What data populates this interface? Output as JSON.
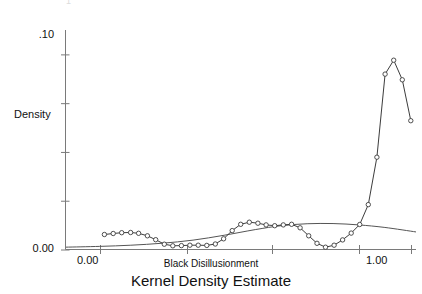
{
  "figure": {
    "caption": "Kernel Density Estimate",
    "top_fragment": "1"
  },
  "chart_data": {
    "type": "line",
    "title": "Kernel Density Estimate",
    "xlabel": "Black Disillusionment",
    "ylabel": "Density",
    "xlim": [
      -0.13,
      1.22
    ],
    "ylim": [
      0.0,
      0.1125
    ],
    "grid": false,
    "legend": false,
    "x_tick_values": [
      0.0,
      0.335,
      0.665,
      1.0,
      1.2
    ],
    "x_tick_labels": [
      "0.00",
      "",
      "",
      "1.00",
      ""
    ],
    "y_tick_values": [
      0.0,
      0.025,
      0.05,
      0.075,
      0.1
    ],
    "y_tick_labels": [
      "0.00",
      "",
      "",
      "",
      ".10"
    ],
    "series": [
      {
        "name": "Kernel density estimate",
        "style": "line-with-circle-markers",
        "color": "#3c3c3c",
        "marker": "open-circle",
        "x": [
          0.018,
          0.052,
          0.085,
          0.119,
          0.15,
          0.184,
          0.216,
          0.249,
          0.282,
          0.315,
          0.348,
          0.38,
          0.413,
          0.446,
          0.478,
          0.511,
          0.544,
          0.577,
          0.61,
          0.642,
          0.675,
          0.708,
          0.74,
          0.773,
          0.806,
          0.838,
          0.871,
          0.904,
          0.937,
          0.97,
          1.003,
          1.036,
          1.069,
          1.101,
          1.134,
          1.167,
          1.2
        ],
        "y": [
          0.0077,
          0.0082,
          0.0086,
          0.0087,
          0.0083,
          0.007,
          0.005,
          0.0027,
          0.0019,
          0.002,
          0.0022,
          0.0022,
          0.0021,
          0.0028,
          0.0055,
          0.0097,
          0.0129,
          0.014,
          0.0135,
          0.0126,
          0.0122,
          0.0126,
          0.0129,
          0.0111,
          0.007,
          0.0032,
          0.0012,
          0.0022,
          0.0049,
          0.0084,
          0.0128,
          0.023,
          0.0473,
          0.0899,
          0.097,
          0.087,
          0.066
        ],
        "peak": {
          "x": 1.134,
          "y": 0.097
        }
      },
      {
        "name": "Smooth reference density",
        "style": "smooth-line",
        "color": "#555555",
        "marker": "none",
        "x": [
          -0.13,
          0.0,
          0.12,
          0.24,
          0.36,
          0.48,
          0.6,
          0.7,
          0.8,
          0.9,
          1.0,
          1.1,
          1.22
        ],
        "y": [
          0.0012,
          0.0016,
          0.0022,
          0.0032,
          0.0048,
          0.0073,
          0.0102,
          0.0122,
          0.0132,
          0.0133,
          0.0126,
          0.0113,
          0.009
        ]
      }
    ],
    "annotations": []
  },
  "axes": {
    "y_label": "Density",
    "y_top_label": ".10",
    "y_bottom_label": "0.00",
    "x_left_label": "0.00",
    "x_right_label": "1.00",
    "x_title": "Black Disillusionment"
  }
}
